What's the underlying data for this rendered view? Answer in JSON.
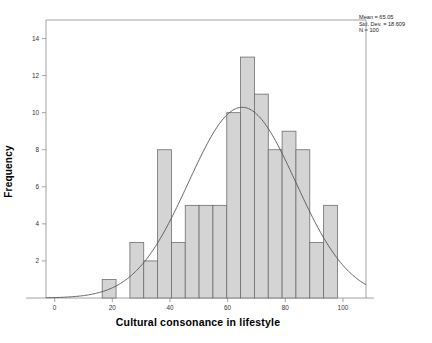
{
  "chart_data": {
    "type": "bar",
    "title": "",
    "subtitle": "",
    "xlabel": "Cultural consonance in lifestyle",
    "ylabel": "Frequency",
    "xlim": [
      -3,
      108
    ],
    "ylim": [
      0,
      15
    ],
    "grid": false,
    "legend_position": "none",
    "bin_width": 4.8,
    "bin_starts": [
      16.5,
      21.3,
      26.1,
      30.9,
      35.7,
      40.5,
      45.3,
      50.1,
      54.9,
      59.7,
      64.5,
      69.3,
      74.1,
      78.9,
      83.7,
      88.5,
      93.3
    ],
    "categories": [
      "16.5-21.3",
      "21.3-26.1",
      "26.1-30.9",
      "30.9-35.7",
      "35.7-40.5",
      "40.5-45.3",
      "45.3-50.1",
      "50.1-54.9",
      "54.9-59.7",
      "59.7-64.5",
      "64.5-69.3",
      "69.3-74.1",
      "74.1-78.9",
      "78.9-83.7",
      "83.7-88.5",
      "88.5-93.3",
      "93.3-98.1"
    ],
    "values": [
      1,
      0,
      3,
      2,
      8,
      3,
      5,
      5,
      5,
      10,
      13,
      11,
      8,
      9,
      8,
      3,
      5
    ],
    "xticks": [
      0,
      20,
      40,
      60,
      80,
      100
    ],
    "yticks": [
      2,
      4,
      6,
      8,
      10,
      12,
      14
    ],
    "bar_fill": "#d4d4d4",
    "bar_edge": "#6e6e6e",
    "curve_color": "#555555",
    "axis_color": "#999999",
    "normal_curve": {
      "shown": true,
      "mean": 65.05,
      "std_dev": 18.609,
      "n": 100
    },
    "annotations": {
      "mean": "Mean = 65.05",
      "std_dev": "Std. Dev. = 18.609",
      "n": "N = 100"
    }
  },
  "axes": {
    "y_title": "Frequency",
    "x_title": "Cultural consonance in lifestyle",
    "y_tick_labels": [
      "2",
      "4",
      "6",
      "8",
      "10",
      "12",
      "14"
    ],
    "x_tick_labels": [
      "0",
      "20",
      "40",
      "60",
      "80",
      "100"
    ]
  },
  "stats": {
    "mean": "Mean = 65.05",
    "std_dev": "Std. Dev. = 18.609",
    "n": "N = 100"
  }
}
